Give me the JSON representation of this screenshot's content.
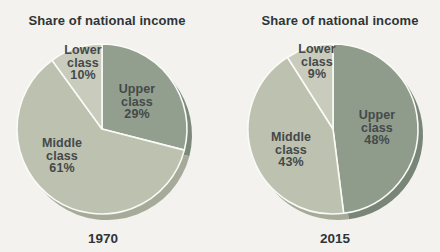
{
  "page": {
    "background_color": "#f3f2ef",
    "text_color": "#45494a",
    "title_color": "#2f3537",
    "separator_color": "#fafaf7"
  },
  "chart_data": [
    {
      "type": "pie",
      "title": "Share of national income",
      "year_label": "1970",
      "unit": "%",
      "direction": "clockwise",
      "start_angle_deg": 0,
      "categories": [
        "Upper class",
        "Middle class",
        "Lower class"
      ],
      "values": [
        29,
        61,
        10
      ],
      "slices": [
        {
          "name": "Upper class",
          "value": 29,
          "label": "Upper\nclass\n29%",
          "color": "#929f8e",
          "shade_color": "#7c897a"
        },
        {
          "name": "Middle class",
          "value": 61,
          "label": "Middle\nclass\n61%",
          "color": "#bcc1b0",
          "shade_color": "#a5aa99"
        },
        {
          "name": "Lower class",
          "value": 10,
          "label": "Lower\nclass\n10%",
          "color": "#c9ccbc",
          "shade_color": "#b2b5a5"
        }
      ]
    },
    {
      "type": "pie",
      "title": "Share of national income",
      "year_label": "2015",
      "unit": "%",
      "direction": "clockwise",
      "start_angle_deg": 0,
      "categories": [
        "Upper class",
        "Middle class",
        "Lower class"
      ],
      "values": [
        48,
        43,
        9
      ],
      "slices": [
        {
          "name": "Upper class",
          "value": 48,
          "label": "Upper\nclass\n48%",
          "color": "#8f9c8c",
          "shade_color": "#798677"
        },
        {
          "name": "Middle class",
          "value": 43,
          "label": "Middle\nclass\n43%",
          "color": "#bcc1b0",
          "shade_color": "#a5aa99"
        },
        {
          "name": "Lower class",
          "value": 9,
          "label": "Lower\nclass\n9%",
          "color": "#c9ccbc",
          "shade_color": "#b2b5a5"
        }
      ]
    }
  ]
}
